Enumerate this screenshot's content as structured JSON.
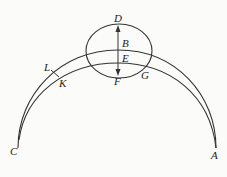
{
  "diagram": {
    "labels": {
      "D": "D",
      "B": "B",
      "E": "E",
      "F": "F",
      "G": "G",
      "L": "L",
      "K": "K",
      "C": "C",
      "A": "A"
    },
    "stroke_color": "#333333"
  }
}
